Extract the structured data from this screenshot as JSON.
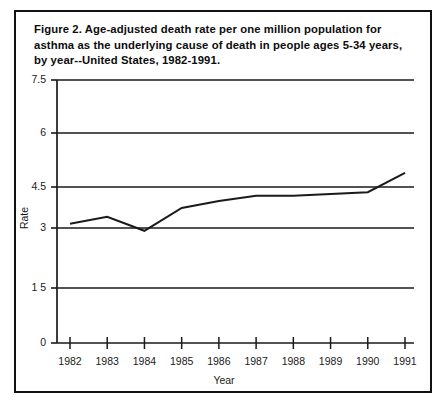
{
  "figure": {
    "caption_lines": [
      "Figure 2.   Age-adjusted death rate per one million population for",
      "asthma as the underlying cause of death in people ages 5-34 years,",
      "by year--United States, 1982-1991."
    ],
    "caption_full": "Figure 2.  Age-adjusted death rate per one million population for asthma as the underlying cause of death in people ages 5-34 years, by year--United States, 1982-1991."
  },
  "chart_data": {
    "type": "line",
    "title": "",
    "xlabel": "Year",
    "ylabel": "Rate",
    "categories": [
      "1982",
      "1983",
      "1984",
      "1985",
      "1986",
      "1987",
      "1988",
      "1989",
      "1990",
      "1991"
    ],
    "x": [
      1982,
      1983,
      1984,
      1985,
      1986,
      1987,
      1988,
      1989,
      1990,
      1991
    ],
    "values": [
      3.4,
      3.6,
      3.2,
      3.85,
      4.05,
      4.2,
      4.2,
      4.25,
      4.3,
      4.85
    ],
    "series": [
      {
        "name": "Asthma death rate",
        "values": [
          3.4,
          3.6,
          3.2,
          3.85,
          4.05,
          4.2,
          4.2,
          4.25,
          4.3,
          4.85
        ]
      }
    ],
    "ylim": [
      0,
      7.5
    ],
    "xlim": [
      1982,
      1991
    ],
    "ytick_labels": [
      "7.5",
      "6",
      "4.5",
      "3",
      "1 5",
      "0"
    ],
    "ytick_values": [
      7.5,
      6,
      4.5,
      3,
      1.5,
      0
    ],
    "xtick_labels": [
      "1982",
      "1983",
      "1984",
      "1985",
      "1986",
      "1987",
      "1988",
      "1989",
      "1990",
      "1991"
    ],
    "grid": true,
    "grid_orientation": "horizontal",
    "legend": "none",
    "line_color": "#1a1a1a",
    "axis_color": "#1a1a1a",
    "background_color": "#ffffff"
  }
}
